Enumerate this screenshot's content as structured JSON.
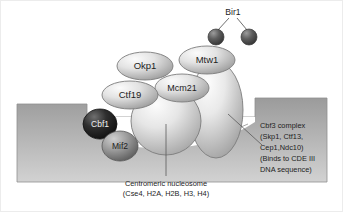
{
  "figure": {
    "background_color": "#ffffff",
    "border_color": "#e8e8e8"
  },
  "chromatin": {
    "name": "chromatin-dna-block",
    "fill_top": "#9b9b9b",
    "fill_bottom": "#cfcfcf",
    "outline_color": "#8a8a8a"
  },
  "proteins": [
    {
      "id": "bir1-sphere-left",
      "label": "",
      "shape": "circle",
      "fill_light": "#8e8e8e",
      "fill_dark": "#454545",
      "text_color": "#ffffff"
    },
    {
      "id": "bir1-sphere-right",
      "label": "",
      "shape": "circle",
      "fill_light": "#8e8e8e",
      "fill_dark": "#454545",
      "text_color": "#ffffff"
    },
    {
      "id": "okp1",
      "label": "Okp1",
      "shape": "ellipse",
      "fill_light": "#f2f2f2",
      "fill_dark": "#a8a8a8",
      "text_color": "#1d1d1d",
      "font_size": 9.5
    },
    {
      "id": "ctf19",
      "label": "Ctf19",
      "shape": "ellipse",
      "fill_light": "#f2f2f2",
      "fill_dark": "#a8a8a8",
      "text_color": "#1d1d1d",
      "font_size": 9.5
    },
    {
      "id": "mcm21",
      "label": "Mcm21",
      "shape": "ellipse",
      "fill_light": "#eeeeee",
      "fill_dark": "#a4a4a4",
      "text_color": "#1d1d1d",
      "font_size": 9
    },
    {
      "id": "mtw1",
      "label": "Mtw1",
      "shape": "ellipse",
      "fill_light": "#f2f2f2",
      "fill_dark": "#a8a8a8",
      "text_color": "#1d1d1d",
      "font_size": 9.5
    },
    {
      "id": "cbf1",
      "label": "Cbf1",
      "shape": "circle",
      "fill_light": "#6d6d6d",
      "fill_dark": "#1a1a1a",
      "text_color": "#f0f0f0",
      "font_size": 8.5
    },
    {
      "id": "mif2",
      "label": "Mif2",
      "shape": "circle",
      "fill_light": "#c4c4c4",
      "fill_dark": "#6f6f6f",
      "text_color": "#1d1d1d",
      "font_size": 8.5
    },
    {
      "id": "centromeric-nucleosome",
      "label": "",
      "shape": "circle",
      "fill_light": "#f4f4f4",
      "fill_dark": "#a9a9a9",
      "text_color": "#1d1d1d"
    },
    {
      "id": "cbf3-complex-body",
      "label": "",
      "shape": "ellipse",
      "fill_light": "#f2f2f2",
      "fill_dark": "#a6a6a6",
      "text_color": "#1d1d1d"
    }
  ],
  "labels": {
    "bir1": "Bir1",
    "okp1": "Okp1",
    "ctf19": "Ctf19",
    "mcm21": "Mcm21",
    "mtw1": "Mtw1",
    "cbf1": "Cbf1",
    "mif2": "Mif2"
  },
  "callouts": {
    "nucleosome": {
      "name": "centromeric-nucleosome-callout",
      "lines": [
        "Centromeric nucleosome",
        "(Cse4, H2A, H2B, H3, H4)"
      ]
    },
    "cbf3": {
      "name": "cbf3-complex-callout",
      "lines": [
        "Cbf3 complex",
        "(Skp1, Ctf13,",
        "Cep1,Ndc10)",
        "(Binds to CDE III",
        "DNA sequence)"
      ]
    }
  },
  "leader_lines": {
    "color": "#5a5a5a"
  }
}
